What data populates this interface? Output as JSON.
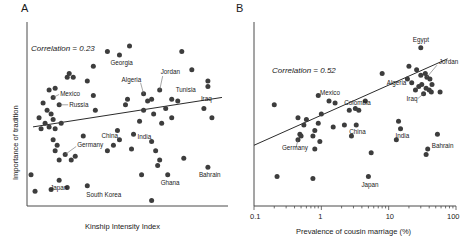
{
  "figure": {
    "width": 469,
    "height": 242,
    "background": "#ffffff",
    "dot_color": "#3d3d3d",
    "axis_color": "#4a4a4a",
    "line_color": "#2b2b2b"
  },
  "panels": {
    "a": {
      "letter": "A",
      "annotation": "Correlation = 0.23",
      "ylabel": "Importance of tradition",
      "xlabel": "Kinship Intensity Index",
      "xticks": [],
      "yticks": []
    },
    "b": {
      "letter": "B",
      "annotation": "Correlation = 0.52",
      "ylabel": "",
      "xlabel": "Prevalence of cousin marriage (%)",
      "xticks": [
        "0.1",
        "1",
        "10",
        "100"
      ],
      "yticks": []
    }
  },
  "chart_data": [
    {
      "type": "scatter",
      "panel": "A",
      "title": "",
      "xlabel": "Kinship Intensity Index",
      "ylabel": "Importance of tradition",
      "annotation": "Correlation = 0.23",
      "correlation": 0.23,
      "xscale": "linear",
      "yscale": "linear",
      "xlim": [
        0,
        100
      ],
      "ylim": [
        0,
        100
      ],
      "grid": false,
      "legend": "none",
      "trendline": {
        "x1": 3,
        "y1": 43,
        "x2": 97,
        "y2": 59
      },
      "labeled_points": [
        {
          "label": "Georgia",
          "x": 46,
          "y": 82
        },
        {
          "label": "Mexico",
          "x": 13,
          "y": 59
        },
        {
          "label": "Russia",
          "x": 16,
          "y": 55
        },
        {
          "label": "Algeria",
          "x": 58,
          "y": 61
        },
        {
          "label": "Jordan",
          "x": 66,
          "y": 63
        },
        {
          "label": "Tunisia",
          "x": 72,
          "y": 58
        },
        {
          "label": "Iraq",
          "x": 88,
          "y": 53
        },
        {
          "label": "China",
          "x": 45,
          "y": 41
        },
        {
          "label": "India",
          "x": 53,
          "y": 39
        },
        {
          "label": "Germany",
          "x": 19,
          "y": 28
        },
        {
          "label": "Japan",
          "x": 16,
          "y": 14
        },
        {
          "label": "South Korea",
          "x": 30,
          "y": 11
        },
        {
          "label": "Ghana",
          "x": 70,
          "y": 17
        },
        {
          "label": "Bahrain",
          "x": 90,
          "y": 21
        }
      ],
      "unlabeled_points": [
        {
          "x": 40,
          "y": 84
        },
        {
          "x": 51,
          "y": 87
        },
        {
          "x": 77,
          "y": 84
        },
        {
          "x": 33,
          "y": 76
        },
        {
          "x": 82,
          "y": 74
        },
        {
          "x": 30,
          "y": 68
        },
        {
          "x": 20,
          "y": 70
        },
        {
          "x": 21,
          "y": 72
        },
        {
          "x": 23,
          "y": 70
        },
        {
          "x": 11,
          "y": 63
        },
        {
          "x": 14,
          "y": 64
        },
        {
          "x": 33,
          "y": 60
        },
        {
          "x": 90,
          "y": 68
        },
        {
          "x": 90,
          "y": 65
        },
        {
          "x": 49,
          "y": 55
        },
        {
          "x": 50,
          "y": 58
        },
        {
          "x": 60,
          "y": 57
        },
        {
          "x": 62,
          "y": 58
        },
        {
          "x": 75,
          "y": 57
        },
        {
          "x": 58,
          "y": 52
        },
        {
          "x": 63,
          "y": 50
        },
        {
          "x": 69,
          "y": 53
        },
        {
          "x": 56,
          "y": 46
        },
        {
          "x": 67,
          "y": 45
        },
        {
          "x": 72,
          "y": 48
        },
        {
          "x": 92,
          "y": 48
        },
        {
          "x": 34,
          "y": 52
        },
        {
          "x": 8,
          "y": 56
        },
        {
          "x": 10,
          "y": 52
        },
        {
          "x": 12,
          "y": 50
        },
        {
          "x": 13,
          "y": 47
        },
        {
          "x": 9,
          "y": 45
        },
        {
          "x": 6,
          "y": 48
        },
        {
          "x": 7,
          "y": 42
        },
        {
          "x": 11,
          "y": 43
        },
        {
          "x": 14,
          "y": 42
        },
        {
          "x": 17,
          "y": 45
        },
        {
          "x": 46,
          "y": 36
        },
        {
          "x": 43,
          "y": 33
        },
        {
          "x": 52,
          "y": 31
        },
        {
          "x": 62,
          "y": 35
        },
        {
          "x": 64,
          "y": 30
        },
        {
          "x": 66,
          "y": 25
        },
        {
          "x": 65,
          "y": 22
        },
        {
          "x": 78,
          "y": 26
        },
        {
          "x": 13,
          "y": 36
        },
        {
          "x": 15,
          "y": 33
        },
        {
          "x": 14,
          "y": 30
        },
        {
          "x": 16,
          "y": 25
        },
        {
          "x": 22,
          "y": 25
        },
        {
          "x": 24,
          "y": 27
        },
        {
          "x": 2,
          "y": 17
        },
        {
          "x": 4,
          "y": 8
        },
        {
          "x": 12,
          "y": 9
        },
        {
          "x": 20,
          "y": 10
        },
        {
          "x": 62,
          "y": 3
        },
        {
          "x": 28,
          "y": 38
        },
        {
          "x": 40,
          "y": 30
        },
        {
          "x": 57,
          "y": 17
        }
      ]
    },
    {
      "type": "scatter",
      "panel": "B",
      "title": "",
      "xlabel": "Prevalence of cousin marriage (%)",
      "ylabel": "",
      "annotation": "Correlation = 0.52",
      "correlation": 0.52,
      "xscale": "log",
      "yscale": "linear",
      "xlim": [
        0.1,
        100
      ],
      "ylim": [
        0,
        100
      ],
      "grid": false,
      "legend": "none",
      "xticks_major": [
        0.1,
        1,
        10,
        100
      ],
      "trendline": {
        "x1": 0.1,
        "y1": 33,
        "x2": 75,
        "y2": 80
      },
      "labeled_points": [
        {
          "label": "Egypt",
          "x": 30,
          "y": 86
        },
        {
          "label": "Mexico",
          "x": 1.3,
          "y": 57
        },
        {
          "label": "Colombia",
          "x": 2.6,
          "y": 52
        },
        {
          "label": "Algeria",
          "x": 22,
          "y": 67
        },
        {
          "label": "Jordan",
          "x": 37,
          "y": 70
        },
        {
          "label": "Iraq",
          "x": 33,
          "y": 61
        },
        {
          "label": "China",
          "x": 3.3,
          "y": 44
        },
        {
          "label": "India",
          "x": 15,
          "y": 42
        },
        {
          "label": "Germany",
          "x": 0.45,
          "y": 36
        },
        {
          "label": "Japan",
          "x": 5,
          "y": 16
        },
        {
          "label": "Bahrain",
          "x": 38,
          "y": 31
        }
      ],
      "unlabeled_points": [
        {
          "x": 8,
          "y": 72
        },
        {
          "x": 20,
          "y": 76
        },
        {
          "x": 26,
          "y": 74
        },
        {
          "x": 19,
          "y": 69
        },
        {
          "x": 30,
          "y": 71
        },
        {
          "x": 35,
          "y": 72
        },
        {
          "x": 41,
          "y": 69
        },
        {
          "x": 44,
          "y": 66
        },
        {
          "x": 40,
          "y": 63
        },
        {
          "x": 43,
          "y": 62
        },
        {
          "x": 36,
          "y": 64
        },
        {
          "x": 31,
          "y": 66
        },
        {
          "x": 28,
          "y": 65
        },
        {
          "x": 25,
          "y": 63
        },
        {
          "x": 58,
          "y": 62
        },
        {
          "x": 0.9,
          "y": 60
        },
        {
          "x": 1.6,
          "y": 56
        },
        {
          "x": 4.5,
          "y": 57
        },
        {
          "x": 3.2,
          "y": 53
        },
        {
          "x": 3.6,
          "y": 52
        },
        {
          "x": 0.2,
          "y": 55
        },
        {
          "x": 0.45,
          "y": 48
        },
        {
          "x": 0.6,
          "y": 47
        },
        {
          "x": 0.55,
          "y": 44
        },
        {
          "x": 0.9,
          "y": 45
        },
        {
          "x": 1.5,
          "y": 43
        },
        {
          "x": 2.2,
          "y": 44
        },
        {
          "x": 0.48,
          "y": 39
        },
        {
          "x": 0.5,
          "y": 38
        },
        {
          "x": 0.75,
          "y": 38
        },
        {
          "x": 0.8,
          "y": 41
        },
        {
          "x": 0.95,
          "y": 35
        },
        {
          "x": 2.8,
          "y": 38
        },
        {
          "x": 14,
          "y": 46
        },
        {
          "x": 13,
          "y": 36
        },
        {
          "x": 53,
          "y": 39
        },
        {
          "x": 36,
          "y": 28
        },
        {
          "x": 5.5,
          "y": 29
        },
        {
          "x": 0.8,
          "y": 31
        },
        {
          "x": 0.22,
          "y": 16
        },
        {
          "x": 0.75,
          "y": 15
        },
        {
          "x": 1.0,
          "y": 50
        }
      ]
    }
  ]
}
